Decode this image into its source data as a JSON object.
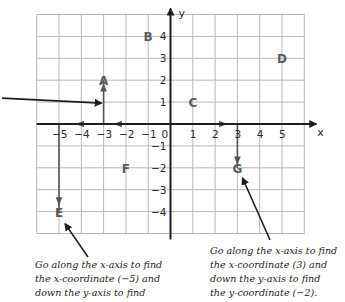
{
  "chart_data": {
    "type": "scatter",
    "title": "",
    "xlabel": "x",
    "ylabel": "y",
    "xlim": [
      -6,
      6
    ],
    "ylim": [
      -5,
      5
    ],
    "grid": true,
    "x_ticks": [
      "-5",
      "-4",
      "-3",
      "-2",
      "-1",
      "0",
      "1",
      "2",
      "3",
      "4",
      "5"
    ],
    "y_ticks": [
      "4",
      "3",
      "2",
      "1",
      "-1",
      "-2",
      "-3",
      "-4"
    ],
    "points": [
      {
        "label": "A",
        "x": -3,
        "y": 2
      },
      {
        "label": "B",
        "x": -1,
        "y": 4
      },
      {
        "label": "C",
        "x": 1,
        "y": 1
      },
      {
        "label": "D",
        "x": 5,
        "y": 3
      },
      {
        "label": "E",
        "x": -5,
        "y": -4
      },
      {
        "label": "F",
        "x": -2,
        "y": -2
      },
      {
        "label": "G",
        "x": 3,
        "y": -2
      }
    ],
    "guides": [
      {
        "target": "A",
        "path": [
          [
            0,
            0
          ],
          [
            -3,
            0
          ],
          [
            -3,
            2
          ]
        ]
      },
      {
        "target": "E",
        "path": [
          [
            0,
            0
          ],
          [
            -5,
            0
          ],
          [
            -5,
            -4
          ]
        ]
      },
      {
        "target": "G",
        "path": [
          [
            0,
            0
          ],
          [
            3,
            0
          ],
          [
            3,
            -2
          ]
        ]
      }
    ]
  },
  "annotations": {
    "e_note": [
      "Go along the x-axis to find",
      "the x-coordinate (−5) and",
      "down the y-axis to find"
    ],
    "g_note": [
      "Go along the x-axis to find",
      "the x-coordinate (3) and",
      "down the y-axis to find",
      "the y-coordinate (−2)."
    ]
  },
  "colors": {
    "axis": "#1e1e1e",
    "grid": "#b8b8b8",
    "guide": "#555555",
    "point_label": "#5c5c5c"
  }
}
